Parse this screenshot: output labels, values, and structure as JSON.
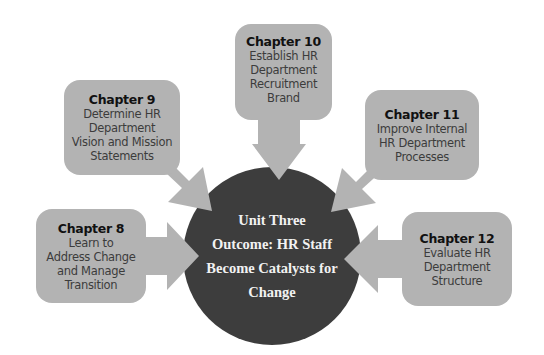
{
  "diagram": {
    "type": "hub-and-spoke",
    "colors": {
      "background": "#ffffff",
      "box_fill": "#b3b3b3",
      "arrow_fill": "#b3b3b3",
      "center_fill": "#3d3d3d",
      "center_text": "#f2f2f2",
      "box_title_text": "#111111",
      "box_body_text": "#3c3c3c"
    },
    "center": {
      "label": "Unit Three Outcome: HR Staff Become Catalysts for Change",
      "lines": [
        "Unit Three",
        "Outcome: HR Staff",
        "Become Catalysts for",
        "Change"
      ]
    },
    "chapters": [
      {
        "id": "ch8",
        "title": "Chapter 8",
        "lines": [
          "Learn to",
          "Address Change",
          "and Manage",
          "Transition"
        ],
        "arrow_direction": "right"
      },
      {
        "id": "ch9",
        "title": "Chapter 9",
        "lines": [
          "Determine HR",
          "Department",
          "Vision and Mission",
          "Statements"
        ],
        "arrow_direction": "down-right"
      },
      {
        "id": "ch10",
        "title": "Chapter 10",
        "lines": [
          "Establish HR",
          "Department",
          "Recruitment",
          "Brand"
        ],
        "arrow_direction": "down"
      },
      {
        "id": "ch11",
        "title": "Chapter 11",
        "lines": [
          "Improve Internal",
          "HR Department",
          "Processes"
        ],
        "arrow_direction": "down-left"
      },
      {
        "id": "ch12",
        "title": "Chapter 12",
        "lines": [
          "Evaluate HR",
          "Department",
          "Structure"
        ],
        "arrow_direction": "left"
      }
    ]
  }
}
